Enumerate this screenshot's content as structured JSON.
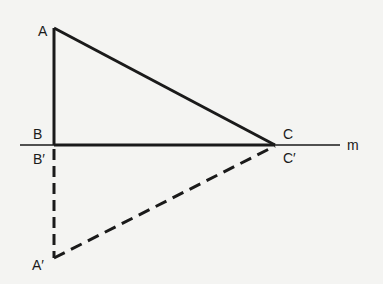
{
  "diagram": {
    "background": "#f4f4f2",
    "stroke_color": "#1a1a1a",
    "points": {
      "A": {
        "label": "A",
        "x": 54,
        "y": 28
      },
      "B": {
        "label": "B",
        "x": 54,
        "y": 145
      },
      "C": {
        "label": "C",
        "x": 275,
        "y": 145
      },
      "A_prime": {
        "label": "A′",
        "x": 54,
        "y": 258
      },
      "B_prime": {
        "label": "B′",
        "x": 54,
        "y": 145
      },
      "C_prime": {
        "label": "C′",
        "x": 275,
        "y": 145
      }
    },
    "line_m": {
      "label": "m",
      "x1": 20,
      "y1": 145,
      "x2": 340,
      "y2": 145
    },
    "original_triangle": {
      "vertices": [
        "A",
        "B",
        "C"
      ],
      "style": "solid"
    },
    "image_triangle": {
      "vertices": [
        "A′",
        "B′",
        "C′"
      ],
      "style": "dashed"
    }
  }
}
